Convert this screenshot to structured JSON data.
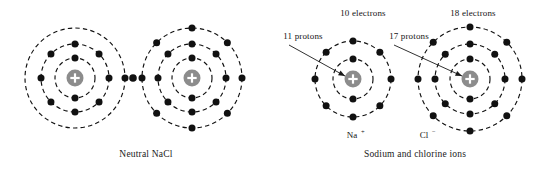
{
  "figure": {
    "background_color": "#ffffff",
    "electron_color": "#111111",
    "nucleus_color": "#8c8c8c",
    "ring_color": "#111111",
    "text_color": "#141414"
  },
  "captions": {
    "left": "Neutral NaCl",
    "right": "Sodium and chlorine ions"
  },
  "annotations": {
    "electrons_left_ion": "10 electrons",
    "electrons_right_ion": "18 electrons",
    "protons_left_ion": "11 protons",
    "protons_right_ion": "17 protons"
  },
  "ion_labels": {
    "sodium_symbol": "Na",
    "sodium_charge": "+",
    "chlorine_symbol": "Cl",
    "chlorine_charge": "−"
  },
  "nucleus_glyph": "plus-sign",
  "atoms": [
    {
      "id": "neutral-sodium-atom",
      "group": "neutral-nacl",
      "label": "Neutral sodium atom",
      "cx": 75,
      "cy": 78,
      "nucleus_r": 8.5,
      "shells": [
        {
          "r": 20,
          "electrons": 2,
          "start_angle": 90
        },
        {
          "r": 34,
          "electrons": 8,
          "start_angle": 90
        },
        {
          "r": 50,
          "electrons": 1,
          "start_angle": 0
        }
      ]
    },
    {
      "id": "neutral-chlorine-atom",
      "group": "neutral-nacl",
      "label": "Neutral chlorine atom",
      "cx": 192,
      "cy": 78,
      "nucleus_r": 8.5,
      "shells": [
        {
          "r": 20,
          "electrons": 2,
          "start_angle": 90
        },
        {
          "r": 34,
          "electrons": 8,
          "start_angle": 90
        },
        {
          "r": 50,
          "electrons": 8,
          "start_angle": 90
        }
      ]
    },
    {
      "id": "sodium-ion-atom",
      "group": "ions",
      "label": "Sodium ion Na+",
      "cx": 353,
      "cy": 79,
      "nucleus_r": 8.5,
      "shells": [
        {
          "r": 20,
          "electrons": 2,
          "start_angle": 90
        },
        {
          "r": 38,
          "electrons": 8,
          "start_angle": 90
        }
      ]
    },
    {
      "id": "chloride-ion-atom",
      "group": "ions",
      "label": "Chloride ion Cl-",
      "cx": 470,
      "cy": 79,
      "nucleus_r": 8.5,
      "shells": [
        {
          "r": 20,
          "electrons": 2,
          "start_angle": 90
        },
        {
          "r": 35,
          "electrons": 8,
          "start_angle": 90
        },
        {
          "r": 52,
          "electrons": 8,
          "start_angle": 90
        }
      ]
    }
  ],
  "shared_electrons": [
    {
      "id": "bonding-electron",
      "x": 133,
      "y": 78
    }
  ],
  "pointers": [
    {
      "id": "pointer-11-protons",
      "from_x": 289,
      "from_y": 45,
      "to_x": 345,
      "to_y": 76
    },
    {
      "id": "pointer-17-protons",
      "from_x": 394,
      "from_y": 45,
      "to_x": 462,
      "to_y": 76
    }
  ],
  "text_positions": {
    "electrons_left_ion": {
      "x": 363,
      "y": 16
    },
    "electrons_right_ion": {
      "x": 473,
      "y": 16
    },
    "protons_left_ion": {
      "x": 303,
      "y": 39
    },
    "protons_right_ion": {
      "x": 409,
      "y": 39
    },
    "sodium_label": {
      "x": 352,
      "y": 138
    },
    "chlorine_label": {
      "x": 424,
      "y": 138
    },
    "caption_left": {
      "x": 146,
      "y": 157
    },
    "caption_right": {
      "x": 415,
      "y": 157
    }
  }
}
